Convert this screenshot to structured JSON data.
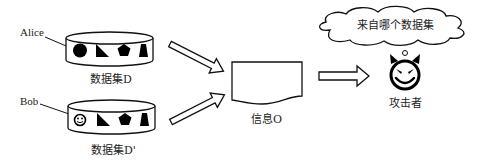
{
  "users": [
    {
      "name": "Alice",
      "dataset_label": "数据集D",
      "marker_shape": "filled-circle"
    },
    {
      "name": "Bob",
      "dataset_label": "数据集D'",
      "marker_shape": "smiley-face"
    }
  ],
  "dataset_shapes": [
    "right-triangle",
    "pentagon",
    "trapezoid"
  ],
  "output": {
    "label": "信息O"
  },
  "attacker": {
    "label": "攻击者",
    "thought": "来自哪个数据集",
    "icon": "devil-face-icon"
  },
  "colors": {
    "stroke": "#111111",
    "fill": "#000000",
    "background": "#ffffff"
  }
}
